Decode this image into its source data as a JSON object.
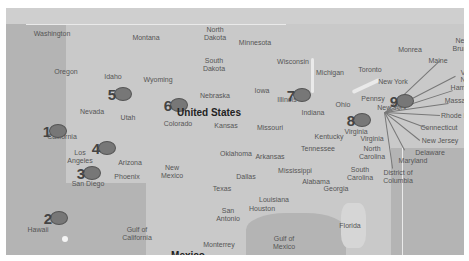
{
  "map": {
    "country_label": "United States",
    "labels": [
      {
        "text": "Washington",
        "x": 52,
        "y": 34
      },
      {
        "text": "Montana",
        "x": 146,
        "y": 38
      },
      {
        "text": "North\nDakota",
        "x": 215,
        "y": 34
      },
      {
        "text": "Minnesota",
        "x": 255,
        "y": 43
      },
      {
        "text": "Oregon",
        "x": 66,
        "y": 72
      },
      {
        "text": "Idaho",
        "x": 113,
        "y": 77
      },
      {
        "text": "Wyoming",
        "x": 158,
        "y": 80
      },
      {
        "text": "South\nDakota",
        "x": 214,
        "y": 65
      },
      {
        "text": "Wisconsin",
        "x": 293,
        "y": 62
      },
      {
        "text": "Michigan",
        "x": 330,
        "y": 73
      },
      {
        "text": "Toronto",
        "x": 370,
        "y": 70
      },
      {
        "text": "Monrea",
        "x": 410,
        "y": 50
      },
      {
        "text": "Maine",
        "x": 438,
        "y": 61
      },
      {
        "text": "New York",
        "x": 393,
        "y": 82
      },
      {
        "text": "Nevada",
        "x": 92,
        "y": 112
      },
      {
        "text": "Utah",
        "x": 128,
        "y": 118
      },
      {
        "text": "Colorado",
        "x": 178,
        "y": 124
      },
      {
        "text": "Nebraska",
        "x": 215,
        "y": 96
      },
      {
        "text": "Iowa",
        "x": 262,
        "y": 91
      },
      {
        "text": "Illinois",
        "x": 287,
        "y": 100
      },
      {
        "text": "Indiana",
        "x": 313,
        "y": 113
      },
      {
        "text": "Ohio",
        "x": 343,
        "y": 105
      },
      {
        "text": "Pennsy",
        "x": 373,
        "y": 99
      },
      {
        "text": "New York",
        "x": 392,
        "y": 108
      },
      {
        "text": "Kansas",
        "x": 226,
        "y": 126
      },
      {
        "text": "Missouri",
        "x": 270,
        "y": 128
      },
      {
        "text": "Kentucky",
        "x": 329,
        "y": 137
      },
      {
        "text": "Virginia",
        "x": 356,
        "y": 132
      },
      {
        "text": "Virginia",
        "x": 372,
        "y": 139
      },
      {
        "text": "North\nCarolina",
        "x": 372,
        "y": 153
      },
      {
        "text": "California",
        "x": 62,
        "y": 137
      },
      {
        "text": "Los\nAngeles",
        "x": 80,
        "y": 157
      },
      {
        "text": "Arizona",
        "x": 130,
        "y": 163
      },
      {
        "text": "Phoenix",
        "x": 127,
        "y": 177
      },
      {
        "text": "San Diego",
        "x": 88,
        "y": 184
      },
      {
        "text": "New\nMexico",
        "x": 172,
        "y": 172
      },
      {
        "text": "Oklahoma",
        "x": 236,
        "y": 154
      },
      {
        "text": "Arkansas",
        "x": 270,
        "y": 157
      },
      {
        "text": "Tennessee",
        "x": 318,
        "y": 149
      },
      {
        "text": "Dallas",
        "x": 246,
        "y": 177
      },
      {
        "text": "Mississippi",
        "x": 295,
        "y": 171
      },
      {
        "text": "Alabama",
        "x": 316,
        "y": 182
      },
      {
        "text": "South\nCarolina",
        "x": 360,
        "y": 174
      },
      {
        "text": "Georgia",
        "x": 336,
        "y": 189
      },
      {
        "text": "Texas",
        "x": 222,
        "y": 189
      },
      {
        "text": "Louisiana",
        "x": 274,
        "y": 200
      },
      {
        "text": "Houston",
        "x": 262,
        "y": 209
      },
      {
        "text": "San\nAntonio",
        "x": 228,
        "y": 215
      },
      {
        "text": "Hawaii",
        "x": 38,
        "y": 230
      },
      {
        "text": "Gulf of\nCalifornia",
        "x": 137,
        "y": 234
      },
      {
        "text": "Gulf of\nMexico",
        "x": 284,
        "y": 243
      },
      {
        "text": "Monterrey",
        "x": 219,
        "y": 245
      },
      {
        "text": "Florida",
        "x": 350,
        "y": 226
      },
      {
        "text": "District of\nColumbia",
        "x": 398,
        "y": 177
      },
      {
        "text": "Maryland",
        "x": 413,
        "y": 161
      },
      {
        "text": "Delaware",
        "x": 430,
        "y": 153
      },
      {
        "text": "New Jersey",
        "x": 440,
        "y": 141
      },
      {
        "text": "Connecticut",
        "x": 439,
        "y": 128
      },
      {
        "text": "Rhode Is",
        "x": 455,
        "y": 116
      },
      {
        "text": "Massa",
        "x": 455,
        "y": 101
      },
      {
        "text": "Ham",
        "x": 458,
        "y": 88
      },
      {
        "text": "N",
        "x": 463,
        "y": 80
      },
      {
        "text": "V",
        "x": 463,
        "y": 73
      },
      {
        "text": "Ne\nBrun",
        "x": 460,
        "y": 45
      }
    ],
    "big_labels": [
      {
        "text": "Mexico",
        "x": 188,
        "y": 256
      }
    ],
    "markers": [
      {
        "id": "1",
        "x": 58,
        "y": 131
      },
      {
        "id": "2",
        "x": 59,
        "y": 218
      },
      {
        "id": "3",
        "x": 92,
        "y": 173
      },
      {
        "id": "4",
        "x": 107,
        "y": 148
      },
      {
        "id": "5",
        "x": 123,
        "y": 94
      },
      {
        "id": "6",
        "x": 179,
        "y": 105
      },
      {
        "id": "7",
        "x": 302,
        "y": 95
      },
      {
        "id": "8",
        "x": 362,
        "y": 120
      },
      {
        "id": "9",
        "x": 405,
        "y": 101
      }
    ],
    "colors": {
      "marker_fill": "#777777",
      "land": "#d6d6d6",
      "ocean": "#b4b4b4"
    }
  }
}
